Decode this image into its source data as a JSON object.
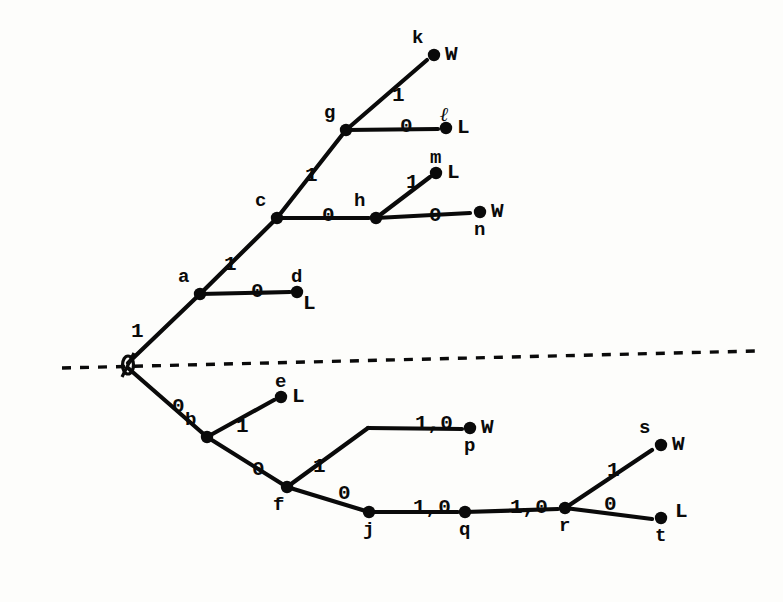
{
  "figure": {
    "type": "game-tree-diagram",
    "ink_color": "#0a0a0a",
    "paper_color": "#fdfdfb",
    "root_symbol": "Ø"
  },
  "divider": {
    "name": "horizontal-dashed-line",
    "style": "dashed",
    "x_start": 62,
    "y_start": 368,
    "x_end": 756,
    "y_end": 351
  },
  "nodes": [
    {
      "id": "root",
      "label": "Ø",
      "x": 128,
      "y": 365,
      "kind": "root",
      "label_pos": "on",
      "outcome": ""
    },
    {
      "id": "a",
      "label": "a",
      "x": 200,
      "y": 294,
      "kind": "internal",
      "label_pos": "above-left",
      "outcome": ""
    },
    {
      "id": "b",
      "label": "b",
      "x": 207,
      "y": 437,
      "kind": "internal",
      "label_pos": "above-left",
      "outcome": ""
    },
    {
      "id": "c",
      "label": "c",
      "x": 277,
      "y": 218,
      "kind": "internal",
      "label_pos": "above-left",
      "outcome": ""
    },
    {
      "id": "d",
      "label": "d",
      "x": 297,
      "y": 292,
      "kind": "terminal",
      "label_pos": "above",
      "outcome": "L"
    },
    {
      "id": "e",
      "label": "e",
      "x": 281,
      "y": 397,
      "kind": "terminal",
      "label_pos": "above",
      "outcome": "L"
    },
    {
      "id": "f",
      "label": "f",
      "x": 287,
      "y": 487,
      "kind": "internal",
      "label_pos": "below-left",
      "outcome": ""
    },
    {
      "id": "g",
      "label": "g",
      "x": 346,
      "y": 130,
      "kind": "internal",
      "label_pos": "above-left",
      "outcome": ""
    },
    {
      "id": "h",
      "label": "h",
      "x": 376,
      "y": 218,
      "kind": "internal",
      "label_pos": "above-left",
      "outcome": ""
    },
    {
      "id": "j",
      "label": "j",
      "x": 369,
      "y": 512,
      "kind": "internal",
      "label_pos": "below",
      "outcome": ""
    },
    {
      "id": "k",
      "label": "k",
      "x": 434,
      "y": 55,
      "kind": "terminal",
      "label_pos": "above-left",
      "outcome": "W"
    },
    {
      "id": "l",
      "label": "ℓ",
      "x": 446,
      "y": 128,
      "kind": "terminal",
      "label_pos": "above",
      "outcome": "L"
    },
    {
      "id": "m",
      "label": "m",
      "x": 436,
      "y": 173,
      "kind": "terminal",
      "label_pos": "above",
      "outcome": "L"
    },
    {
      "id": "n",
      "label": "n",
      "x": 480,
      "y": 212,
      "kind": "terminal",
      "label_pos": "below",
      "outcome": "W"
    },
    {
      "id": "p",
      "label": "p",
      "x": 470,
      "y": 428,
      "kind": "terminal",
      "label_pos": "below",
      "outcome": "W"
    },
    {
      "id": "q",
      "label": "q",
      "x": 465,
      "y": 512,
      "kind": "internal",
      "label_pos": "below",
      "outcome": ""
    },
    {
      "id": "r",
      "label": "r",
      "x": 565,
      "y": 508,
      "kind": "internal",
      "label_pos": "below",
      "outcome": ""
    },
    {
      "id": "s",
      "label": "s",
      "x": 661,
      "y": 445,
      "kind": "terminal",
      "label_pos": "above-left",
      "outcome": "W"
    },
    {
      "id": "t",
      "label": "t",
      "x": 661,
      "y": 518,
      "kind": "terminal",
      "label_pos": "below",
      "outcome": "L"
    }
  ],
  "edges": [
    {
      "from": "root",
      "to": "a",
      "label": "1",
      "lx": 131,
      "ly": 321
    },
    {
      "from": "root",
      "to": "b",
      "label": "0",
      "lx": 172,
      "ly": 396
    },
    {
      "from": "a",
      "to": "c",
      "label": "1",
      "lx": 224,
      "ly": 254
    },
    {
      "from": "a",
      "to": "d",
      "label": "0",
      "lx": 251,
      "ly": 281
    },
    {
      "from": "c",
      "to": "g",
      "label": "1",
      "lx": 305,
      "ly": 165
    },
    {
      "from": "c",
      "to": "h",
      "label": "0",
      "lx": 322,
      "ly": 205
    },
    {
      "from": "g",
      "to": "k",
      "label": "1",
      "lx": 392,
      "ly": 85
    },
    {
      "from": "g",
      "to": "l",
      "label": "0",
      "lx": 400,
      "ly": 116
    },
    {
      "from": "h",
      "to": "m",
      "label": "1",
      "lx": 406,
      "ly": 172
    },
    {
      "from": "h",
      "to": "n",
      "label": "0",
      "lx": 429,
      "ly": 205
    },
    {
      "from": "b",
      "to": "e",
      "label": "1",
      "lx": 236,
      "ly": 416
    },
    {
      "from": "b",
      "to": "f",
      "label": "0",
      "lx": 252,
      "ly": 459
    },
    {
      "from": "f",
      "to": "p",
      "label": "1",
      "lx": 313,
      "ly": 456
    },
    {
      "from": "f",
      "to": "j",
      "label": "0",
      "lx": 338,
      "ly": 483
    },
    {
      "from": "p",
      "to": "p_end",
      "label": "1,0",
      "lx": 415,
      "ly": 413
    },
    {
      "from": "j",
      "to": "q",
      "label": "1,0",
      "lx": 413,
      "ly": 497
    },
    {
      "from": "q",
      "to": "r",
      "label": "1,0",
      "lx": 510,
      "ly": 497
    },
    {
      "from": "r",
      "to": "s",
      "label": "1",
      "lx": 607,
      "ly": 460
    },
    {
      "from": "r",
      "to": "t",
      "label": "0",
      "lx": 604,
      "ly": 494
    }
  ],
  "segments": [
    {
      "name": "edge-root-a",
      "x1": 128,
      "y1": 363,
      "x2": 200,
      "y2": 294
    },
    {
      "name": "edge-root-b",
      "x1": 128,
      "y1": 368,
      "x2": 207,
      "y2": 437
    },
    {
      "name": "edge-a-c",
      "x1": 200,
      "y1": 294,
      "x2": 277,
      "y2": 218
    },
    {
      "name": "edge-a-d",
      "x1": 200,
      "y1": 294,
      "x2": 290,
      "y2": 292
    },
    {
      "name": "edge-c-g",
      "x1": 277,
      "y1": 218,
      "x2": 346,
      "y2": 130
    },
    {
      "name": "edge-c-h",
      "x1": 277,
      "y1": 218,
      "x2": 369,
      "y2": 218
    },
    {
      "name": "edge-g-k",
      "x1": 346,
      "y1": 130,
      "x2": 427,
      "y2": 60
    },
    {
      "name": "edge-g-l",
      "x1": 346,
      "y1": 130,
      "x2": 438,
      "y2": 129
    },
    {
      "name": "edge-h-m",
      "x1": 376,
      "y1": 218,
      "x2": 430,
      "y2": 177
    },
    {
      "name": "edge-h-n",
      "x1": 376,
      "y1": 218,
      "x2": 470,
      "y2": 213
    },
    {
      "name": "edge-b-e",
      "x1": 207,
      "y1": 437,
      "x2": 274,
      "y2": 400
    },
    {
      "name": "edge-b-f",
      "x1": 207,
      "y1": 437,
      "x2": 287,
      "y2": 487
    },
    {
      "name": "edge-f-p1",
      "x1": 287,
      "y1": 487,
      "x2": 368,
      "y2": 428
    },
    {
      "name": "edge-f-j",
      "x1": 287,
      "y1": 487,
      "x2": 369,
      "y2": 512
    },
    {
      "name": "edge-p-chain",
      "x1": 368,
      "y1": 428,
      "x2": 462,
      "y2": 429
    },
    {
      "name": "edge-j-q",
      "x1": 369,
      "y1": 512,
      "x2": 458,
      "y2": 512
    },
    {
      "name": "edge-q-r",
      "x1": 465,
      "y1": 512,
      "x2": 558,
      "y2": 509
    },
    {
      "name": "edge-r-s",
      "x1": 565,
      "y1": 508,
      "x2": 652,
      "y2": 450
    },
    {
      "name": "edge-r-t",
      "x1": 565,
      "y1": 508,
      "x2": 652,
      "y2": 519
    }
  ]
}
